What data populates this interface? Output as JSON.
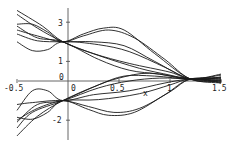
{
  "chart_data": {
    "type": "line",
    "title": "",
    "xlabel": "x",
    "ylabel": "",
    "xlim": [
      -0.5,
      1.5
    ],
    "ylim": [
      -2.7,
      3.8
    ],
    "grid": false,
    "legend": "none",
    "x_ticks": [
      "-0.5",
      "0",
      "0.5",
      "1",
      "1.5"
    ],
    "y_ticks": [
      "3",
      "1",
      "0",
      "-2"
    ],
    "colors": {
      "line": "#1a1a1a",
      "axis": "#555555",
      "background": "#ffffff"
    },
    "series": [
      {
        "name": "upper-1",
        "points": [
          [
            -0.5,
            3.6
          ],
          [
            -0.25,
            2.8
          ],
          [
            -0.05,
            2.0
          ],
          [
            0.25,
            1.4
          ],
          [
            0.6,
            0.9
          ],
          [
            1.0,
            0.45
          ],
          [
            1.2,
            0.1
          ],
          [
            1.5,
            0.3
          ]
        ]
      },
      {
        "name": "upper-2",
        "points": [
          [
            -0.5,
            3.4
          ],
          [
            -0.3,
            2.7
          ],
          [
            -0.05,
            2.0
          ],
          [
            0.3,
            1.3
          ],
          [
            0.7,
            0.65
          ],
          [
            1.0,
            0.3
          ],
          [
            1.2,
            0.1
          ],
          [
            1.5,
            0.15
          ]
        ]
      },
      {
        "name": "upper-3",
        "points": [
          [
            -0.5,
            2.9
          ],
          [
            -0.35,
            2.9
          ],
          [
            -0.2,
            2.5
          ],
          [
            -0.05,
            2.0
          ],
          [
            0.15,
            2.4
          ],
          [
            0.35,
            2.7
          ],
          [
            0.55,
            2.6
          ],
          [
            0.85,
            1.4
          ],
          [
            1.2,
            0.1
          ],
          [
            1.5,
            0.0
          ]
        ]
      },
      {
        "name": "upper-4",
        "points": [
          [
            -0.5,
            2.6
          ],
          [
            -0.3,
            2.3
          ],
          [
            -0.05,
            2.0
          ],
          [
            0.15,
            2.3
          ],
          [
            0.4,
            2.6
          ],
          [
            0.65,
            2.2
          ],
          [
            0.95,
            1.1
          ],
          [
            1.2,
            0.1
          ],
          [
            1.5,
            -0.1
          ]
        ]
      },
      {
        "name": "upper-5",
        "points": [
          [
            -0.5,
            2.4
          ],
          [
            -0.3,
            2.05
          ],
          [
            -0.05,
            2.0
          ],
          [
            0.25,
            2.0
          ],
          [
            0.55,
            1.8
          ],
          [
            0.85,
            1.0
          ],
          [
            1.2,
            0.1
          ],
          [
            1.5,
            0.2
          ]
        ]
      },
      {
        "name": "upper-6",
        "points": [
          [
            -0.5,
            2.0
          ],
          [
            -0.35,
            1.55
          ],
          [
            -0.2,
            1.6
          ],
          [
            -0.05,
            2.0
          ],
          [
            0.3,
            1.85
          ],
          [
            0.6,
            1.5
          ],
          [
            0.95,
            0.7
          ],
          [
            1.2,
            0.1
          ],
          [
            1.5,
            0.05
          ]
        ]
      },
      {
        "name": "upper-7",
        "points": [
          [
            -0.5,
            2.8
          ],
          [
            -0.3,
            2.2
          ],
          [
            -0.05,
            2.0
          ],
          [
            0.3,
            1.1
          ],
          [
            0.6,
            0.55
          ],
          [
            0.9,
            0.35
          ],
          [
            1.2,
            0.1
          ],
          [
            1.5,
            -0.05
          ]
        ]
      },
      {
        "name": "lower-1",
        "points": [
          [
            -0.5,
            -2.8
          ],
          [
            -0.3,
            -1.8
          ],
          [
            -0.05,
            -1.0
          ],
          [
            0.25,
            -0.3
          ],
          [
            0.5,
            0.15
          ],
          [
            0.8,
            0.4
          ],
          [
            1.2,
            0.1
          ],
          [
            1.5,
            0.35
          ]
        ]
      },
      {
        "name": "lower-2",
        "points": [
          [
            -0.5,
            -2.4
          ],
          [
            -0.35,
            -1.6
          ],
          [
            -0.05,
            -1.0
          ],
          [
            0.3,
            -0.2
          ],
          [
            0.55,
            0.25
          ],
          [
            0.85,
            0.25
          ],
          [
            1.2,
            0.1
          ],
          [
            1.5,
            0.2
          ]
        ]
      },
      {
        "name": "lower-3",
        "points": [
          [
            -0.5,
            -1.5
          ],
          [
            -0.35,
            -0.5
          ],
          [
            -0.2,
            -0.5
          ],
          [
            -0.05,
            -1.0
          ],
          [
            0.25,
            -0.7
          ],
          [
            0.6,
            -0.5
          ],
          [
            0.95,
            -0.1
          ],
          [
            1.2,
            0.1
          ],
          [
            1.5,
            0.1
          ]
        ]
      },
      {
        "name": "lower-4",
        "points": [
          [
            -0.5,
            -2.0
          ],
          [
            -0.3,
            -1.4
          ],
          [
            -0.05,
            -1.0
          ],
          [
            0.3,
            -0.95
          ],
          [
            0.7,
            -0.65
          ],
          [
            1.0,
            -0.2
          ],
          [
            1.2,
            0.1
          ],
          [
            1.5,
            0.0
          ]
        ]
      },
      {
        "name": "lower-5",
        "points": [
          [
            -0.5,
            -1.85
          ],
          [
            -0.35,
            -1.95
          ],
          [
            -0.2,
            -1.6
          ],
          [
            -0.05,
            -1.0
          ],
          [
            0.2,
            -1.45
          ],
          [
            0.4,
            -1.75
          ],
          [
            0.65,
            -1.6
          ],
          [
            0.95,
            -0.7
          ],
          [
            1.2,
            0.1
          ],
          [
            1.5,
            -0.1
          ]
        ]
      },
      {
        "name": "lower-6",
        "points": [
          [
            -0.5,
            -1.2
          ],
          [
            -0.35,
            -1.1
          ],
          [
            -0.05,
            -1.0
          ],
          [
            0.2,
            -1.3
          ],
          [
            0.45,
            -1.6
          ],
          [
            0.7,
            -1.4
          ],
          [
            1.0,
            -0.55
          ],
          [
            1.2,
            0.1
          ],
          [
            1.5,
            0.15
          ]
        ]
      },
      {
        "name": "lower-7",
        "points": [
          [
            -0.5,
            -2.1
          ],
          [
            -0.3,
            -1.2
          ],
          [
            -0.05,
            -1.0
          ],
          [
            0.3,
            -0.35
          ],
          [
            0.6,
            0.0
          ],
          [
            0.9,
            0.15
          ],
          [
            1.2,
            0.1
          ],
          [
            1.5,
            0.05
          ]
        ]
      }
    ]
  },
  "labels": {
    "x_axis_name": "x",
    "x_ticks": [
      {
        "text": "-0.5",
        "value": -0.5
      },
      {
        "text": "0",
        "value": 0
      },
      {
        "text": "0.5",
        "value": 0.5
      },
      {
        "text": "1",
        "value": 1
      },
      {
        "text": "1.5",
        "value": 1.5
      }
    ],
    "y_ticks": [
      {
        "text": "3",
        "value": 3
      },
      {
        "text": "1",
        "value": 1
      },
      {
        "text": "0",
        "value": 0
      },
      {
        "text": "-2",
        "value": -2
      }
    ]
  }
}
